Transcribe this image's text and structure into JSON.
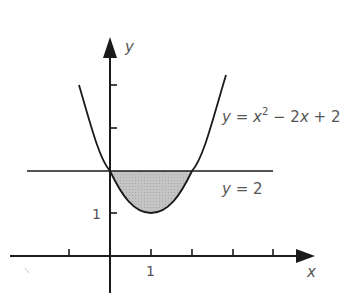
{
  "figure": {
    "axes": {
      "x_label": "x",
      "y_label": "y",
      "x_tick_label": "1",
      "y_tick_label": "1"
    },
    "curves": {
      "parabola_label": "y = x² − 2x + 2",
      "parabola_label_parts": {
        "lhs": "y = x",
        "sup": "2",
        "rhs": " − 2x + 2"
      },
      "line_label": "y = 2"
    },
    "region": {
      "description": "shaded region between y = 2 and y = x² − 2x + 2 for 0 ≤ x ≤ 2",
      "fill": "#bdbdbd"
    },
    "colors": {
      "stroke": "#1a1a1a",
      "text": "#555555"
    }
  }
}
